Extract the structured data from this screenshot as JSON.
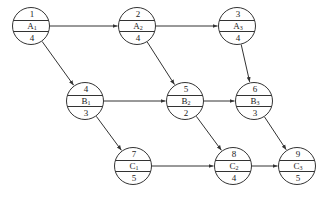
{
  "diagram": {
    "type": "network-planning-diagram",
    "nodes": [
      {
        "id": "1",
        "label": "A",
        "sub": "1",
        "duration": "4",
        "cx": 31,
        "cy": 26
      },
      {
        "id": "2",
        "label": "A",
        "sub": "2",
        "duration": "4",
        "cx": 137,
        "cy": 26
      },
      {
        "id": "3",
        "label": "A",
        "sub": "3",
        "duration": "4",
        "cx": 237,
        "cy": 26
      },
      {
        "id": "4",
        "label": "B",
        "sub": "1",
        "duration": "3",
        "cx": 85,
        "cy": 101
      },
      {
        "id": "5",
        "label": "B",
        "sub": "2",
        "duration": "2",
        "cx": 185,
        "cy": 101
      },
      {
        "id": "6",
        "label": "B",
        "sub": "3",
        "duration": "3",
        "cx": 254,
        "cy": 101
      },
      {
        "id": "7",
        "label": "C",
        "sub": "1",
        "duration": "5",
        "cx": 133,
        "cy": 166
      },
      {
        "id": "8",
        "label": "C",
        "sub": "2",
        "duration": "4",
        "cx": 233,
        "cy": 166
      },
      {
        "id": "9",
        "label": "C",
        "sub": "3",
        "duration": "5",
        "cx": 297,
        "cy": 166
      }
    ],
    "edges": [
      {
        "from": "1",
        "to": "2"
      },
      {
        "from": "2",
        "to": "3"
      },
      {
        "from": "1",
        "to": "4"
      },
      {
        "from": "2",
        "to": "5"
      },
      {
        "from": "3",
        "to": "6"
      },
      {
        "from": "4",
        "to": "5"
      },
      {
        "from": "5",
        "to": "6"
      },
      {
        "from": "4",
        "to": "7"
      },
      {
        "from": "5",
        "to": "8"
      },
      {
        "from": "6",
        "to": "9"
      },
      {
        "from": "7",
        "to": "8"
      },
      {
        "from": "8",
        "to": "9"
      }
    ],
    "colors": {
      "line": "#333333",
      "background": "#ffffff",
      "text": "#222222"
    }
  }
}
